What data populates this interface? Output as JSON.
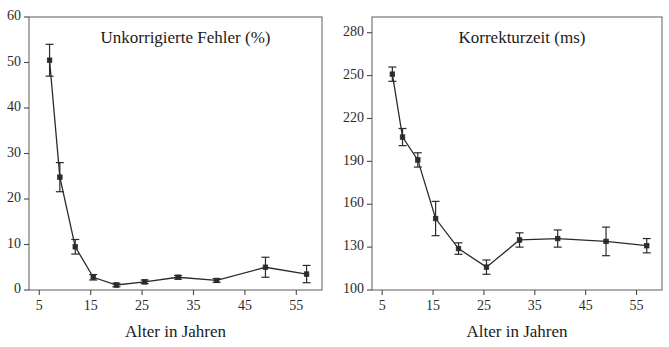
{
  "figure": {
    "background": "#ffffff",
    "line_color": "#2b2b2b",
    "axis_color": "#4a4a4a",
    "shared_xlabel": "Alter in Jahren"
  },
  "chart_data": [
    {
      "type": "line",
      "title": "Unkorrigierte Fehler (%)",
      "xlabel": "Alter in Jahren",
      "ylabel": "",
      "xlim": [
        3,
        60
      ],
      "ylim": [
        0,
        60
      ],
      "xticks": [
        5,
        15,
        25,
        35,
        45,
        55
      ],
      "yticks": [
        0,
        10,
        20,
        30,
        40,
        50,
        60
      ],
      "grid": false,
      "legend": "none",
      "marker": "square",
      "error_bars": "vertical",
      "x": [
        7,
        9,
        12,
        15.5,
        20,
        25.5,
        32,
        39.5,
        49,
        57
      ],
      "values": [
        50.5,
        24.8,
        9.5,
        2.8,
        1.1,
        1.8,
        2.8,
        2.1,
        5.0,
        3.5
      ],
      "err_low": [
        3.5,
        3.2,
        1.6,
        0.6,
        0.4,
        0.4,
        0.4,
        0.4,
        2.2,
        1.9
      ],
      "err_high": [
        3.5,
        3.2,
        1.6,
        0.6,
        0.4,
        0.4,
        0.4,
        0.4,
        2.2,
        1.9
      ]
    },
    {
      "type": "line",
      "title": "Korrekturzeit (ms)",
      "xlabel": "Alter in Jahren",
      "ylabel": "",
      "xlim": [
        3,
        60
      ],
      "ylim": [
        100,
        291
      ],
      "xticks": [
        5,
        15,
        25,
        35,
        45,
        55
      ],
      "yticks": [
        100,
        130,
        160,
        190,
        220,
        250,
        280
      ],
      "grid": false,
      "legend": "none",
      "marker": "square",
      "error_bars": "vertical",
      "x": [
        7,
        9,
        12,
        15.5,
        20,
        25.5,
        32,
        39.5,
        49,
        57
      ],
      "values": [
        251,
        207,
        191,
        150,
        129,
        116,
        135,
        136,
        134,
        131
      ],
      "err_low": [
        5,
        6,
        5,
        12,
        4,
        5,
        5,
        6,
        10,
        5
      ],
      "err_high": [
        5,
        6,
        5,
        12,
        4,
        5,
        5,
        6,
        10,
        5
      ]
    }
  ]
}
